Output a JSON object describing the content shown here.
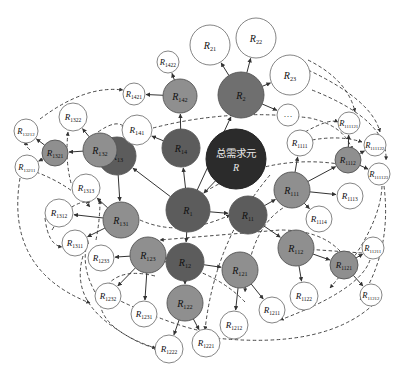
{
  "colors": {
    "root": "#2b2b2b",
    "level1": "#5c5c5c",
    "level2": "#6f6f6f",
    "level3": "#8f8f8f",
    "leaf": "#ffffff",
    "stroke": "#555555",
    "edge": "#333333"
  },
  "root": {
    "id": "R",
    "line1": "总需求元",
    "line2": "R",
    "x": 236,
    "y": 159,
    "r": 30
  },
  "nodes": [
    {
      "id": "R1",
      "base": "R",
      "sub": "1",
      "x": 188,
      "y": 210,
      "r": 22,
      "tier": "level1"
    },
    {
      "id": "R2",
      "base": "R",
      "sub": "2",
      "x": 241,
      "y": 95,
      "r": 23,
      "tier": "level2"
    },
    {
      "id": "R11",
      "base": "R",
      "sub": "11",
      "x": 248,
      "y": 215,
      "r": 19,
      "tier": "level1"
    },
    {
      "id": "R12",
      "base": "R",
      "sub": "12",
      "x": 185,
      "y": 262,
      "r": 19,
      "tier": "level1"
    },
    {
      "id": "R13",
      "base": "R",
      "sub": "13",
      "x": 117,
      "y": 156,
      "r": 19,
      "tier": "level1"
    },
    {
      "id": "R14",
      "base": "R",
      "sub": "14",
      "x": 181,
      "y": 148,
      "r": 19,
      "tier": "level1"
    },
    {
      "id": "R21",
      "base": "R",
      "sub": "21",
      "x": 210,
      "y": 45,
      "r": 20,
      "tier": "leaf"
    },
    {
      "id": "R22",
      "base": "R",
      "sub": "22",
      "x": 256,
      "y": 38,
      "r": 20,
      "tier": "leaf"
    },
    {
      "id": "R23",
      "base": "R",
      "sub": "23",
      "x": 290,
      "y": 75,
      "r": 20,
      "tier": "leaf"
    },
    {
      "id": "ellipsis",
      "base": "…",
      "sub": "",
      "x": 288,
      "y": 115,
      "r": 11,
      "tier": "leaf"
    },
    {
      "id": "R111",
      "base": "R",
      "sub": "111",
      "x": 292,
      "y": 190,
      "r": 18,
      "tier": "level3"
    },
    {
      "id": "R112",
      "base": "R",
      "sub": "112",
      "x": 296,
      "y": 248,
      "r": 18,
      "tier": "level3"
    },
    {
      "id": "R121",
      "base": "R",
      "sub": "121",
      "x": 240,
      "y": 270,
      "r": 18,
      "tier": "level3"
    },
    {
      "id": "R122",
      "base": "R",
      "sub": "122",
      "x": 185,
      "y": 303,
      "r": 18,
      "tier": "level3"
    },
    {
      "id": "R123",
      "base": "R",
      "sub": "123",
      "x": 148,
      "y": 255,
      "r": 18,
      "tier": "level3"
    },
    {
      "id": "R131",
      "base": "R",
      "sub": "131",
      "x": 121,
      "y": 220,
      "r": 18,
      "tier": "level3"
    },
    {
      "id": "R132",
      "base": "R",
      "sub": "132",
      "x": 100,
      "y": 150,
      "r": 17,
      "tier": "level3"
    },
    {
      "id": "R142",
      "base": "R",
      "sub": "142",
      "x": 180,
      "y": 96,
      "r": 17,
      "tier": "level3"
    },
    {
      "id": "R1321",
      "base": "R",
      "sub": "1321",
      "x": 55,
      "y": 153,
      "r": 13,
      "tier": "level3"
    },
    {
      "id": "R1112",
      "base": "R",
      "sub": "1112",
      "x": 348,
      "y": 160,
      "r": 13,
      "tier": "level3"
    },
    {
      "id": "R1121",
      "base": "R",
      "sub": "1121",
      "x": 344,
      "y": 265,
      "r": 14,
      "tier": "level3"
    },
    {
      "id": "R1422",
      "base": "R",
      "sub": "1422",
      "x": 168,
      "y": 62,
      "r": 11,
      "tier": "leaf"
    },
    {
      "id": "R1421",
      "base": "R",
      "sub": "1421",
      "x": 134,
      "y": 94,
      "r": 11,
      "tier": "leaf"
    },
    {
      "id": "R141",
      "base": "R",
      "sub": "141",
      "x": 137,
      "y": 130,
      "r": 15,
      "tier": "leaf"
    },
    {
      "id": "R1322",
      "base": "R",
      "sub": "1322",
      "x": 73,
      "y": 117,
      "r": 14,
      "tier": "leaf"
    },
    {
      "id": "R13212",
      "base": "R",
      "sub": "13212",
      "x": 26,
      "y": 131,
      "r": 12,
      "tier": "leaf"
    },
    {
      "id": "R13211",
      "base": "R",
      "sub": "13211",
      "x": 27,
      "y": 167,
      "r": 12,
      "tier": "leaf"
    },
    {
      "id": "R1313",
      "base": "R",
      "sub": "1313",
      "x": 86,
      "y": 188,
      "r": 14,
      "tier": "leaf"
    },
    {
      "id": "R1312",
      "base": "R",
      "sub": "1312",
      "x": 59,
      "y": 213,
      "r": 14,
      "tier": "leaf"
    },
    {
      "id": "R1311",
      "base": "R",
      "sub": "1311",
      "x": 75,
      "y": 243,
      "r": 13,
      "tier": "leaf"
    },
    {
      "id": "R1233",
      "base": "R",
      "sub": "1233",
      "x": 101,
      "y": 258,
      "r": 13,
      "tier": "leaf"
    },
    {
      "id": "R1232",
      "base": "R",
      "sub": "1232",
      "x": 108,
      "y": 296,
      "r": 13,
      "tier": "leaf"
    },
    {
      "id": "R1231",
      "base": "R",
      "sub": "1231",
      "x": 144,
      "y": 314,
      "r": 13,
      "tier": "leaf"
    },
    {
      "id": "R1222",
      "base": "R",
      "sub": "1222",
      "x": 169,
      "y": 349,
      "r": 14,
      "tier": "leaf"
    },
    {
      "id": "R1221",
      "base": "R",
      "sub": "1221",
      "x": 206,
      "y": 343,
      "r": 14,
      "tier": "leaf"
    },
    {
      "id": "R1212",
      "base": "R",
      "sub": "1212",
      "x": 234,
      "y": 325,
      "r": 14,
      "tier": "leaf"
    },
    {
      "id": "R1211",
      "base": "R",
      "sub": "1211",
      "x": 272,
      "y": 310,
      "r": 13,
      "tier": "leaf"
    },
    {
      "id": "R1122",
      "base": "R",
      "sub": "1122",
      "x": 304,
      "y": 296,
      "r": 14,
      "tier": "leaf"
    },
    {
      "id": "R11212",
      "base": "R",
      "sub": "11212",
      "x": 371,
      "y": 295,
      "r": 11,
      "tier": "leaf"
    },
    {
      "id": "R11211",
      "base": "R",
      "sub": "11211",
      "x": 373,
      "y": 248,
      "r": 11,
      "tier": "leaf"
    },
    {
      "id": "R1114",
      "base": "R",
      "sub": "1114",
      "x": 319,
      "y": 219,
      "r": 13,
      "tier": "leaf"
    },
    {
      "id": "R1113",
      "base": "R",
      "sub": "1113",
      "x": 350,
      "y": 196,
      "r": 13,
      "tier": "leaf"
    },
    {
      "id": "R1111",
      "base": "R",
      "sub": "1111",
      "x": 300,
      "y": 143,
      "r": 13,
      "tier": "leaf"
    },
    {
      "id": "R111121",
      "base": "R",
      "sub": "111121",
      "x": 349,
      "y": 123,
      "r": 11,
      "tier": "leaf"
    },
    {
      "id": "R111122",
      "base": "R",
      "sub": "111122",
      "x": 375,
      "y": 145,
      "r": 11,
      "tier": "leaf"
    },
    {
      "id": "R111123",
      "base": "R",
      "sub": "111123",
      "x": 379,
      "y": 174,
      "r": 11,
      "tier": "leaf"
    }
  ],
  "edges": [
    [
      "R",
      "R1"
    ],
    [
      "R1",
      "R14"
    ],
    [
      "R1",
      "R11"
    ],
    [
      "R1",
      "R12"
    ],
    [
      "R1",
      "R13"
    ],
    [
      "R1",
      "R2"
    ],
    [
      "R2",
      "R21"
    ],
    [
      "R2",
      "R22"
    ],
    [
      "R2",
      "R23"
    ],
    [
      "R2",
      "ellipsis"
    ],
    [
      "R14",
      "R142"
    ],
    [
      "R14",
      "R141"
    ],
    [
      "R142",
      "R1421"
    ],
    [
      "R142",
      "R1422"
    ],
    [
      "R13",
      "R132"
    ],
    [
      "R13",
      "R131"
    ],
    [
      "R132",
      "R1321"
    ],
    [
      "R132",
      "R1322"
    ],
    [
      "R1321",
      "R13211"
    ],
    [
      "R1321",
      "R13212"
    ],
    [
      "R131",
      "R1313"
    ],
    [
      "R131",
      "R1312"
    ],
    [
      "R131",
      "R1311"
    ],
    [
      "R12",
      "R123"
    ],
    [
      "R12",
      "R122"
    ],
    [
      "R12",
      "R121"
    ],
    [
      "R123",
      "R1233"
    ],
    [
      "R123",
      "R1232"
    ],
    [
      "R123",
      "R1231"
    ],
    [
      "R122",
      "R1222"
    ],
    [
      "R122",
      "R1221"
    ],
    [
      "R121",
      "R1212"
    ],
    [
      "R121",
      "R1211"
    ],
    [
      "R11",
      "R111"
    ],
    [
      "R11",
      "R112"
    ],
    [
      "R111",
      "R1111"
    ],
    [
      "R111",
      "R1112"
    ],
    [
      "R111",
      "R1113"
    ],
    [
      "R111",
      "R1114"
    ],
    [
      "R1112",
      "R111121"
    ],
    [
      "R1112",
      "R111122"
    ],
    [
      "R1112",
      "R111123"
    ],
    [
      "R112",
      "R1121"
    ],
    [
      "R112",
      "R1122"
    ],
    [
      "R1121",
      "R11211"
    ],
    [
      "R1121",
      "R11212"
    ]
  ],
  "dashed": [
    "M 40 119 Q 85 85 123 90",
    "M 98 132 Q 118 118 125 128",
    "M 153 128 Q 230 108 310 118 Q 345 126 352 150",
    "M 185 205 Q 260 150 345 165",
    "M 308 60 Q 348 80 355 112",
    "M 308 70 Q 372 100 380 132",
    "M 312 90 Q 388 120 386 160",
    "M 305 132 Q 330 118 338 122",
    "M 312 140 Q 340 135 362 142",
    "M 270 175 Q 215 240 205 330",
    "M 288 205 Q 250 225 245 292",
    "M 382 186 Q 380 230 330 288",
    "M 384 186 Q 392 250 360 300",
    "M 378 300 Q 330 350 215 338",
    "M 370 260 Q 360 290 280 320",
    "M 340 251 Q 320 230 280 230 L 160 240",
    "M 362 253 L 305 249",
    "M 215 333 Q 180 330 110 296",
    "M 245 302 Q 210 265 140 258",
    "M 155 276 Q 110 265 100 300 Q 100 330 158 349",
    "M 52 230 Q 70 200 90 202",
    "M 45 218 Q 48 245 62 247",
    "M 83 256 Q 70 300 118 330 Q 140 345 156 348",
    "M 20 178 Q 5 270 90 303",
    "M 96 240 Q 100 220 100 200",
    "M 36 172 Q 70 185 90 207",
    "M 71 183 Q 65 160 68 132",
    "M 95 292 Q 80 265 88 240",
    "M 30 150 Q 20 140 28 145",
    "M 140 220 Q 180 238 230 215"
  ]
}
